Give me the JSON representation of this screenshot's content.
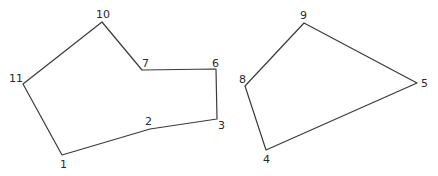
{
  "diagram": {
    "type": "polygon-drawing",
    "polygons": [
      {
        "name": "left-polygon",
        "vertex_order": [
          "1",
          "2",
          "3",
          "6",
          "7",
          "10",
          "11"
        ]
      },
      {
        "name": "right-polygon",
        "vertex_order": [
          "4",
          "5",
          "9",
          "8"
        ]
      }
    ],
    "vertex_labels": [
      "1",
      "2",
      "3",
      "4",
      "5",
      "6",
      "7",
      "8",
      "9",
      "10",
      "11"
    ]
  }
}
